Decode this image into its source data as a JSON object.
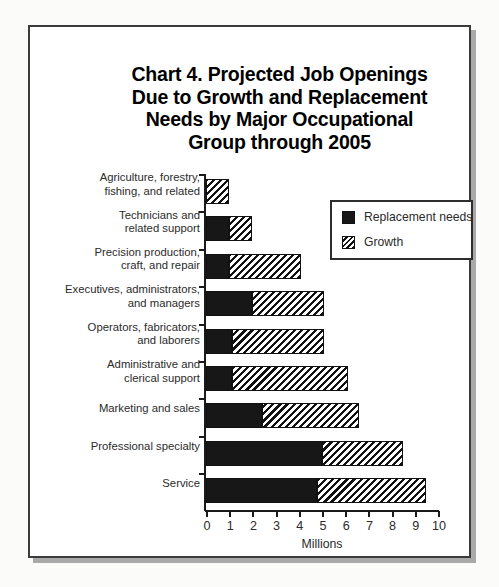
{
  "chart_data": {
    "type": "bar",
    "orientation": "horizontal",
    "stacked": true,
    "title": "Chart 4. Projected Job Openings Due to Growth and Replacement Needs by Major Occupational Group through 2005",
    "title_lines": [
      "Chart 4. Projected Job Openings",
      "Due to Growth and Replacement",
      "Needs by Major Occupational",
      "Group through 2005"
    ],
    "xlabel": "Millions",
    "ylabel": "",
    "xlim": [
      0,
      10
    ],
    "xticks": [
      0,
      1,
      2,
      3,
      4,
      5,
      6,
      7,
      8,
      9,
      10
    ],
    "xtick_labels": [
      "0",
      "1",
      "2",
      "3",
      "4",
      "5",
      "6",
      "7",
      "8",
      "9",
      "10"
    ],
    "grid": false,
    "legend_position": "top-right",
    "categories": [
      "Agriculture, forestry,\nfishing, and related",
      "Technicians and\nrelated support",
      "Precision production,\ncraft, and repair",
      "Executives, administrators,\nand managers",
      "Operators, fabricators,\nand laborers",
      "Administrative and\nclerical support",
      "Marketing and sales",
      "Professional specialty",
      "Service"
    ],
    "series": [
      {
        "name": "Replacement needs",
        "pattern": "solid",
        "color": "#171717",
        "values": [
          0.0,
          1.0,
          1.0,
          2.0,
          1.1,
          1.1,
          2.4,
          5.0,
          4.8
        ]
      },
      {
        "name": "Growth",
        "pattern": "diagonal-hatch",
        "color": "#ffffff",
        "values": [
          1.0,
          1.0,
          3.1,
          3.1,
          4.0,
          5.0,
          4.2,
          3.5,
          4.7
        ]
      }
    ],
    "totals": [
      1.0,
      2.0,
      4.1,
      5.1,
      5.1,
      6.1,
      6.6,
      8.5,
      9.5
    ]
  },
  "legend": {
    "items": [
      {
        "label": "Replacement needs",
        "swatch": "solid-black-square"
      },
      {
        "label": "Growth",
        "swatch": "hatched-square"
      }
    ]
  }
}
